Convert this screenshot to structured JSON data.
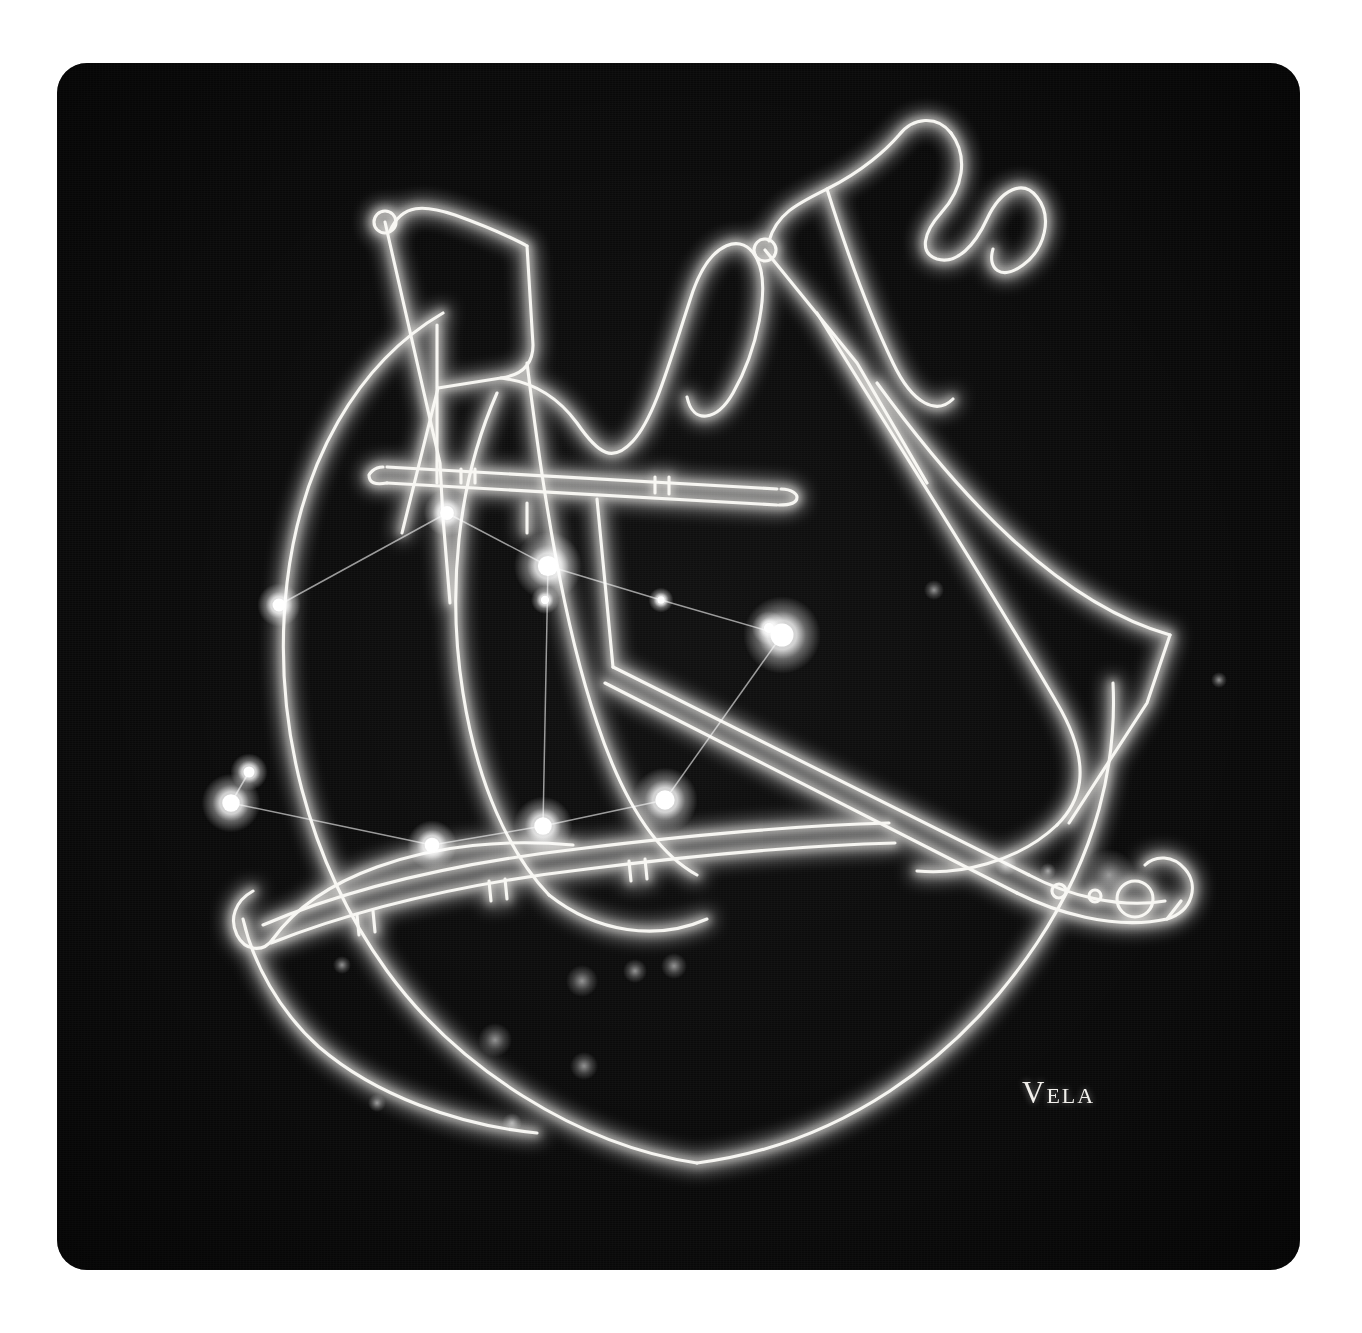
{
  "card": {
    "label": "Vela",
    "background_color": "#090909",
    "page_background_color": "#ffffff",
    "line_color": "#f5f3ee",
    "star_color": "#ffffff",
    "corner_radius_px": 30
  },
  "artwork": {
    "subject": "Vela (the Sails) constellation figure",
    "style": "glowing white line drawing of a ship's sails on black night sky",
    "icons": [
      "mast-icon",
      "sail-icon",
      "pennant-icon",
      "hull-icon",
      "spar-icon",
      "tiller-icon"
    ]
  },
  "chart_data": {
    "type": "scatter",
    "title": "Vela",
    "xlabel": "",
    "ylabel": "",
    "xlim": [
      0,
      1243
    ],
    "ylim": [
      0,
      1207
    ],
    "grid": false,
    "legend": "none",
    "coordinate_space": "card pixels, origin top-left",
    "stars": [
      {
        "name": "star-a",
        "x": 390,
        "y": 450,
        "magnitude_size": 15
      },
      {
        "name": "star-b",
        "x": 491,
        "y": 503,
        "magnitude_size": 22
      },
      {
        "name": "star-c",
        "x": 488,
        "y": 537,
        "magnitude_size": 9
      },
      {
        "name": "star-d",
        "x": 222,
        "y": 542,
        "magnitude_size": 14
      },
      {
        "name": "star-e",
        "x": 604,
        "y": 537,
        "magnitude_size": 8
      },
      {
        "name": "star-f",
        "x": 725,
        "y": 572,
        "magnitude_size": 25
      },
      {
        "name": "star-g",
        "x": 712,
        "y": 565,
        "magnitude_size": 11
      },
      {
        "name": "star-h",
        "x": 192,
        "y": 709,
        "magnitude_size": 12
      },
      {
        "name": "star-i",
        "x": 174,
        "y": 740,
        "magnitude_size": 19
      },
      {
        "name": "star-j",
        "x": 375,
        "y": 782,
        "magnitude_size": 16
      },
      {
        "name": "star-k",
        "x": 486,
        "y": 763,
        "magnitude_size": 19
      },
      {
        "name": "star-l",
        "x": 608,
        "y": 737,
        "magnitude_size": 21
      }
    ],
    "links": [
      {
        "from": "star-d",
        "to": "star-a"
      },
      {
        "from": "star-a",
        "to": "star-b"
      },
      {
        "from": "star-b",
        "to": "star-e"
      },
      {
        "from": "star-e",
        "to": "star-f"
      },
      {
        "from": "star-b",
        "to": "star-k"
      },
      {
        "from": "star-f",
        "to": "star-l"
      },
      {
        "from": "star-l",
        "to": "star-k"
      },
      {
        "from": "star-k",
        "to": "star-j"
      },
      {
        "from": "star-j",
        "to": "star-i"
      },
      {
        "from": "star-i",
        "to": "star-h"
      }
    ],
    "faint_field_stars": [
      {
        "x": 877,
        "y": 527,
        "size": 10
      },
      {
        "x": 949,
        "y": 802,
        "size": 11
      },
      {
        "x": 991,
        "y": 808,
        "size": 8
      },
      {
        "x": 1052,
        "y": 812,
        "size": 26
      },
      {
        "x": 525,
        "y": 918,
        "size": 16
      },
      {
        "x": 578,
        "y": 908,
        "size": 12
      },
      {
        "x": 617,
        "y": 903,
        "size": 13
      },
      {
        "x": 438,
        "y": 977,
        "size": 17
      },
      {
        "x": 527,
        "y": 1003,
        "size": 14
      },
      {
        "x": 320,
        "y": 1040,
        "size": 9
      },
      {
        "x": 455,
        "y": 1060,
        "size": 10
      },
      {
        "x": 1162,
        "y": 617,
        "size": 8
      },
      {
        "x": 285,
        "y": 902,
        "size": 9
      }
    ]
  }
}
